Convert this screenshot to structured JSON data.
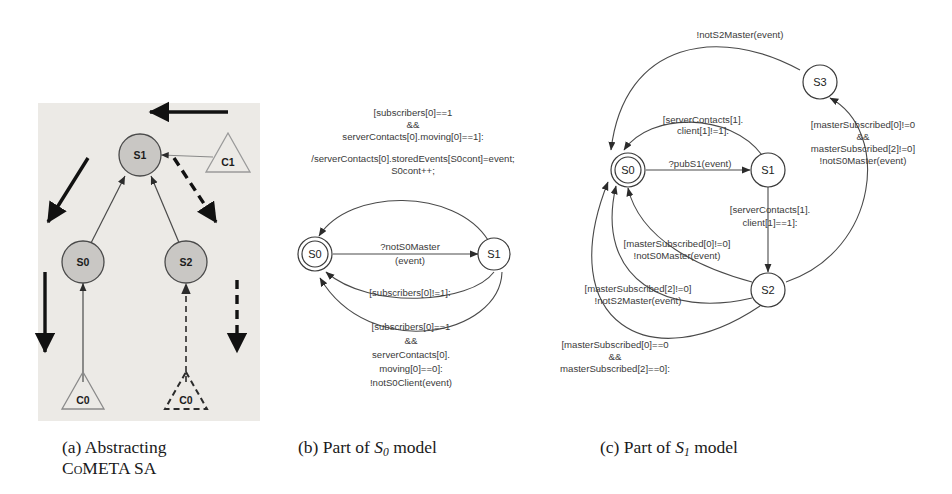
{
  "figure": {
    "panels": [
      {
        "id": "a",
        "caption_line1": "(a)  Abstracting",
        "caption_line2": "CoMETA SA",
        "type": "component-diagram",
        "nodes": [
          {
            "id": "S1",
            "label": "S1",
            "shape": "circle",
            "fill": "#c9c7c4",
            "x": 140,
            "y": 155
          },
          {
            "id": "S0",
            "label": "S0",
            "shape": "circle",
            "fill": "#c9c7c4",
            "x": 83,
            "y": 262
          },
          {
            "id": "S2",
            "label": "S2",
            "shape": "circle",
            "fill": "#c9c7c4",
            "x": 186,
            "y": 262
          },
          {
            "id": "C1",
            "label": "C1",
            "shape": "triangle",
            "style": "solid",
            "x": 228,
            "y": 161
          },
          {
            "id": "C0l",
            "label": "C0",
            "shape": "triangle",
            "style": "solid",
            "x": 83,
            "y": 395
          },
          {
            "id": "C0r",
            "label": "C0",
            "shape": "triangle",
            "style": "dashed",
            "x": 186,
            "y": 395
          }
        ],
        "edges": [
          {
            "from": "S0",
            "to": "S1",
            "style": "solid"
          },
          {
            "from": "S2",
            "to": "S1",
            "style": "solid"
          },
          {
            "from": "C1",
            "to": "S1",
            "style": "solid"
          },
          {
            "from": "C0l",
            "to": "S0",
            "style": "solid"
          },
          {
            "from": "C0r",
            "to": "S2",
            "style": "dashed"
          }
        ],
        "bold_arrows": [
          {
            "name": "top-left-arrow",
            "style": "solid"
          },
          {
            "name": "diagonal-down-arrow",
            "style": "solid"
          },
          {
            "name": "left-down-arrow",
            "style": "solid"
          },
          {
            "name": "diagonal-dashed-arrow",
            "style": "dashed"
          },
          {
            "name": "right-down-dashed-arrow",
            "style": "dashed"
          }
        ]
      },
      {
        "id": "b",
        "caption_pre": "(b)  Part of ",
        "caption_state": "S",
        "caption_sub": "0",
        "caption_post": " model",
        "type": "state-machine",
        "nodes": [
          {
            "id": "S0",
            "label": "S0",
            "initial": true,
            "x": 315,
            "y": 254
          },
          {
            "id": "S1",
            "label": "S1",
            "initial": false,
            "x": 494,
            "y": 254
          }
        ],
        "transitions": [
          {
            "name": "s0-to-s1-top",
            "from": "S0",
            "to": "S1",
            "lines": [
              "[subscribers[0]==1",
              "&&",
              "serverContacts[0].moving[0]==1]:",
              "/serverContacts[0].storedEvents[S0cont]=event;",
              "S0cont++;"
            ]
          },
          {
            "name": "s0-to-s1-straight",
            "from": "S0",
            "to": "S1",
            "lines": [
              "?notS0Master",
              "(event)"
            ]
          },
          {
            "name": "s1-to-s0-mid",
            "from": "S1",
            "to": "S0",
            "lines": [
              "[subscribers[0]!=1]:"
            ]
          },
          {
            "name": "s1-to-s0-bottom",
            "from": "S1",
            "to": "S0",
            "lines": [
              "[subscribers[0]==1",
              "&&",
              "serverContacts[0].",
              "moving[0]==0]:",
              "!notS0Client(event)"
            ]
          }
        ]
      },
      {
        "id": "c",
        "caption_pre": "(c)  Part of ",
        "caption_state": "S",
        "caption_sub": "1",
        "caption_post": " model",
        "type": "state-machine",
        "nodes": [
          {
            "id": "S0",
            "label": "S0",
            "initial": true,
            "x": 628,
            "y": 170
          },
          {
            "id": "S1",
            "label": "S1",
            "initial": false,
            "x": 768,
            "y": 170
          },
          {
            "id": "S3",
            "label": "S3",
            "initial": false,
            "x": 820,
            "y": 82
          },
          {
            "id": "S2",
            "label": "S2",
            "initial": false,
            "x": 768,
            "y": 290
          }
        ],
        "transitions": [
          {
            "name": "s3-to-s0-top",
            "from": "S3",
            "to": "S0",
            "lines": [
              "!notS2Master(event)"
            ]
          },
          {
            "name": "s1-to-s0-upper",
            "from": "S1",
            "to": "S0",
            "lines": [
              "[serverContacts[1].",
              "client[1]!=1]:"
            ]
          },
          {
            "name": "s0-to-s1",
            "from": "S0",
            "to": "S1",
            "lines": [
              "?pubS1(event)"
            ]
          },
          {
            "name": "s2-to-s3",
            "from": "S2",
            "to": "S3",
            "lines": [
              "[masterSubscribed[0]!=0",
              "&&",
              "masterSubscribed[2]!=0]",
              "!notS0Master(event)"
            ]
          },
          {
            "name": "s1-to-s2",
            "from": "S1",
            "to": "S2",
            "lines": [
              "[serverContacts[1].",
              "client[1]==1]:"
            ]
          },
          {
            "name": "s2-to-s0-a",
            "from": "S2",
            "to": "S0",
            "lines": [
              "[masterSubscribed[0]!=0]",
              "!notS0Master(event)"
            ]
          },
          {
            "name": "s2-to-s0-b",
            "from": "S2",
            "to": "S0",
            "lines": [
              "[masterSubscribed[2]!=0]",
              "!notS2Master(event)"
            ]
          },
          {
            "name": "s2-to-s0-c",
            "from": "S2",
            "to": "S0",
            "lines": [
              "[masterSubscribed[0]==0",
              "&&",
              "masterSubscribed[2]==0]:"
            ]
          }
        ]
      }
    ]
  },
  "colors": {
    "panel_a_background": "#eceae6",
    "node_fill_a": "#c9c7c4",
    "stroke": "#2b2b2b",
    "text": "#3a3a3a",
    "page_background": "#ffffff"
  }
}
